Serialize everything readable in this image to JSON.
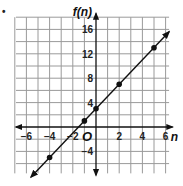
{
  "marker": "•",
  "chart_data": {
    "type": "line",
    "title": "",
    "xlabel": "n",
    "ylabel": "f(n)",
    "origin_label": "O",
    "function": "f(n) = 2n + 3",
    "xlim": [
      -7,
      6
    ],
    "ylim": [
      -8,
      18
    ],
    "grid": true,
    "x_ticks": [
      -6,
      -4,
      -2,
      2,
      4,
      6
    ],
    "y_ticks": [
      16,
      12,
      8,
      4,
      -4
    ],
    "points": [
      {
        "x": -4,
        "y": -5
      },
      {
        "x": -1,
        "y": 1
      },
      {
        "x": 0,
        "y": 3
      },
      {
        "x": 2,
        "y": 7
      },
      {
        "x": 5,
        "y": 13
      }
    ],
    "line_extent": {
      "x1": -5.6,
      "y1": -8.2,
      "x2": 6.3,
      "y2": 15.6
    }
  },
  "colors": {
    "grid": "#9a9a9a",
    "axis": "#111111",
    "line": "#111111",
    "point": "#111111"
  }
}
